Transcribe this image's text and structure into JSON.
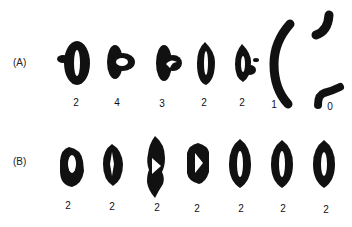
{
  "figure": {
    "panels": [
      {
        "label": "(A)",
        "items": [
          {
            "shape": "ring-with-side-lobe",
            "count": "2"
          },
          {
            "shape": "ring-with-inner-loop",
            "count": "4"
          },
          {
            "shape": "ring-with-hook",
            "count": "3"
          },
          {
            "shape": "closed-ring",
            "count": "2"
          },
          {
            "shape": "ring-with-dot",
            "count": "2"
          },
          {
            "shape": "open-arc",
            "count": "1"
          },
          {
            "shape": "two-fragments",
            "count": "0"
          }
        ]
      },
      {
        "label": "(B)",
        "items": [
          {
            "shape": "ring",
            "count": "2"
          },
          {
            "shape": "ring-notched",
            "count": "2"
          },
          {
            "shape": "ring-pinched",
            "count": "2"
          },
          {
            "shape": "ring-triangular-hole",
            "count": "2"
          },
          {
            "shape": "ring",
            "count": "2"
          },
          {
            "shape": "ring",
            "count": "2"
          },
          {
            "shape": "ring",
            "count": "2"
          }
        ]
      }
    ],
    "ink_color": "#111111"
  }
}
